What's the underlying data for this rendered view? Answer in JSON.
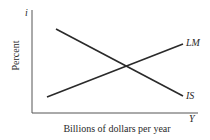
{
  "diagram": {
    "type": "IS-LM model",
    "y_axis": {
      "symbol": "i",
      "label": "Percent"
    },
    "x_axis": {
      "symbol": "Y",
      "label": "Billions of dollars per year"
    },
    "curves": [
      {
        "name": "LM",
        "label": "LM",
        "slope": "upward",
        "from": [
          47,
          97
        ],
        "to": [
          183,
          44
        ]
      },
      {
        "name": "IS",
        "label": "IS",
        "slope": "downward",
        "from": [
          56,
          29
        ],
        "to": [
          183,
          96
        ]
      }
    ],
    "colors": {
      "line": "#2a2a2a",
      "axis": "#444444",
      "background": "#ffffff"
    }
  }
}
